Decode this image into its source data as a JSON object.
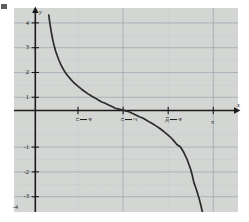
{
  "figure": {
    "background_color": "#d4d6d3",
    "page_color": "#ffffff",
    "axis_color": "#1a1a1a",
    "curve_color": "#2b2b2b",
    "major_grid_color": "#9aa3b0",
    "minor_grid_color": "#b9bec4",
    "corner_mark": "corner-mark"
  },
  "axes": {
    "x_axis_name": "x",
    "y_axis_name": "y"
  },
  "chart_data": {
    "type": "line",
    "title": "",
    "subtitle": "",
    "xlabel": "x",
    "ylabel": "y",
    "function": "y = cot(x)",
    "grid": true,
    "legend": "none",
    "xlim": [
      -0.42,
      3.7
    ],
    "ylim": [
      -4.8,
      4.8
    ],
    "x_ticks": [
      {
        "value": 0.7854,
        "label_num": "π",
        "label_den": "4",
        "kind": "fraction"
      },
      {
        "value": 1.5708,
        "label_num": "π",
        "label_den": "2",
        "kind": "fraction"
      },
      {
        "value": 2.3562,
        "label_num": "3π",
        "label_den": "4",
        "kind": "fraction"
      },
      {
        "value": 3.1416,
        "label_num": "π",
        "label_den": "",
        "kind": "plain"
      }
    ],
    "y_ticks": [
      {
        "value": 4,
        "label": "4"
      },
      {
        "value": 3,
        "label": "3"
      },
      {
        "value": 2,
        "label": "2"
      },
      {
        "value": 1,
        "label": "1"
      },
      {
        "value": -1,
        "label": "-1"
      },
      {
        "value": -2,
        "label": "-2"
      },
      {
        "value": -3,
        "label": "-3"
      },
      {
        "value": -4,
        "label": "-4"
      }
    ],
    "series": [
      {
        "name": "cot(x)",
        "x": [
          0.2199,
          0.2356,
          0.2513,
          0.267,
          0.2827,
          0.2985,
          0.3142,
          0.3456,
          0.377,
          0.4084,
          0.4398,
          0.4712,
          0.5027,
          0.5341,
          0.5655,
          0.6283,
          0.6912,
          0.754,
          0.8168,
          0.8796,
          0.9425,
          1.0053,
          1.0681,
          1.131,
          1.1938,
          1.2566,
          1.3195,
          1.3823,
          1.4451,
          1.508,
          1.5708,
          1.6336,
          1.6965,
          1.7593,
          1.8221,
          1.885,
          1.9478,
          2.0106,
          2.0735,
          2.1363,
          2.1991,
          2.2619,
          2.3248,
          2.3876,
          2.4504,
          2.5133,
          2.5761,
          2.6389,
          2.7018,
          2.7646,
          2.8274,
          2.8588,
          2.8903,
          2.9217,
          2.9531,
          2.9845,
          3.0159,
          3.0473
        ],
        "y": [
          4.47,
          4.16,
          3.89,
          3.65,
          3.43,
          3.24,
          3.07,
          2.78,
          2.54,
          2.33,
          2.15,
          1.99,
          1.85,
          1.73,
          1.62,
          1.43,
          1.26,
          1.12,
          0.99,
          0.87,
          0.76,
          0.66,
          0.57,
          0.47,
          0.38,
          0.32,
          0.24,
          0.16,
          0.08,
          0.04,
          0.0,
          -0.04,
          -0.08,
          -0.16,
          -0.24,
          -0.32,
          -0.38,
          -0.47,
          -0.57,
          -0.66,
          -0.76,
          -0.87,
          -0.99,
          -1.12,
          -1.26,
          -1.43,
          -1.62,
          -1.73,
          -1.99,
          -2.33,
          -2.78,
          -3.07,
          -3.43,
          -3.65,
          -3.89,
          -4.16,
          -4.47,
          -4.82
        ]
      }
    ],
    "asymptotes": [
      0,
      3.1416
    ],
    "zero_crossings": [
      1.5708
    ]
  }
}
